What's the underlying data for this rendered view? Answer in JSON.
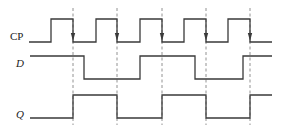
{
  "signals": [
    {
      "name": "CP",
      "italic": false,
      "label_x": 10,
      "label_y": 40
    },
    {
      "name": "D",
      "italic": true,
      "label_x": 16,
      "label_y": 67
    },
    {
      "name": "Q",
      "italic": true,
      "label_x": 16,
      "label_y": 118
    }
  ],
  "clock_falling_edges_x": [
    73,
    117,
    162,
    206,
    250
  ],
  "waveforms": {
    "CP": {
      "low_y": 42,
      "high_y": 19,
      "start_x": 29,
      "end_x": 272,
      "initial": 0,
      "transitions_x": [
        51,
        73,
        96,
        117,
        140,
        162,
        184,
        206,
        228,
        250
      ]
    },
    "D": {
      "low_y": 79,
      "high_y": 56,
      "start_x": 30,
      "end_x": 272,
      "initial": 1,
      "transitions_x": [
        84,
        140,
        195,
        243
      ]
    },
    "Q": {
      "low_y": 118,
      "high_y": 95,
      "start_x": 30,
      "end_x": 272,
      "initial": 0,
      "transitions_x": [
        73,
        117,
        162,
        206,
        250
      ]
    }
  },
  "colors": {
    "line": "#3a3a3a",
    "dashed": "#777777",
    "text": "#222222"
  }
}
